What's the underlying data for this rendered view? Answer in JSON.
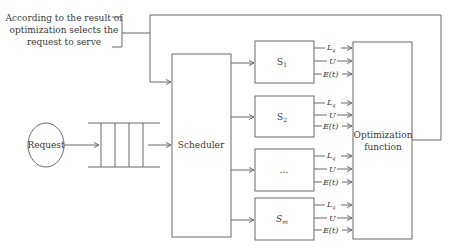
{
  "annotation": {
    "lines": [
      "According to the result of",
      "optimization selects the",
      "request to serve"
    ]
  },
  "request": {
    "label": "Request"
  },
  "queue": {
    "slots": 4
  },
  "scheduler": {
    "label": "Scheduler"
  },
  "servers": [
    {
      "label": "S",
      "sub": "1"
    },
    {
      "label": "S",
      "sub": "2"
    },
    {
      "label": "…",
      "sub": ""
    },
    {
      "label": "S",
      "sub": "m"
    }
  ],
  "metrics": {
    "lq": "L",
    "lq_sub": "q",
    "u": "U",
    "e": "E(t)"
  },
  "optimization": {
    "lines": [
      "Optimization",
      "function"
    ]
  },
  "colors": {
    "line": "#6b6b6b",
    "text": "#3a3a3a",
    "background": "#ffffff"
  }
}
